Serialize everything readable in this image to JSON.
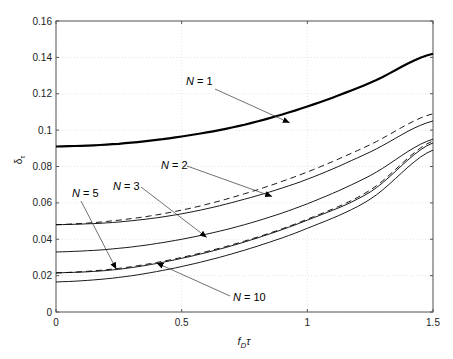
{
  "chart_data": {
    "type": "line",
    "title": "",
    "xlabel": "f_D τ",
    "ylabel": "δ_τ",
    "xlim": [
      0,
      1.5
    ],
    "ylim": [
      0,
      0.16
    ],
    "xticks": [
      "0",
      "0.5",
      "1",
      "1.5"
    ],
    "yticks": [
      "0",
      "0.02",
      "0.04",
      "0.06",
      "0.08",
      "0.1",
      "0.12",
      "0.14",
      "0.16"
    ],
    "grid": true,
    "legend": "none (inline annotations with arrows)",
    "x": [
      0,
      0.25,
      0.5,
      0.75,
      1.0,
      1.25,
      1.5
    ],
    "series": [
      {
        "name": "N = 1",
        "style": "thick solid",
        "values": [
          0.091,
          0.0925,
          0.0965,
          0.103,
          0.113,
          0.126,
          0.142
        ]
      },
      {
        "name": "N = 2 (dashed)",
        "style": "dashed",
        "values": [
          0.048,
          0.0505,
          0.056,
          0.065,
          0.077,
          0.092,
          0.109
        ]
      },
      {
        "name": "N = 2",
        "style": "solid",
        "values": [
          0.048,
          0.0495,
          0.054,
          0.062,
          0.073,
          0.088,
          0.105
        ]
      },
      {
        "name": "N = 3",
        "style": "solid",
        "values": [
          0.033,
          0.035,
          0.04,
          0.048,
          0.0595,
          0.075,
          0.095
        ]
      },
      {
        "name": "N = 5 (dashed)",
        "style": "dashed",
        "values": [
          0.0215,
          0.024,
          0.03,
          0.039,
          0.051,
          0.067,
          0.094
        ]
      },
      {
        "name": "N = 5",
        "style": "solid",
        "values": [
          0.0215,
          0.0235,
          0.0295,
          0.0385,
          0.0505,
          0.066,
          0.093
        ]
      },
      {
        "name": "N = 10",
        "style": "solid",
        "values": [
          0.0165,
          0.019,
          0.025,
          0.034,
          0.046,
          0.062,
          0.089
        ]
      }
    ],
    "annotations": [
      {
        "text": "N = 1",
        "points_to_x": 0.93,
        "points_to_y": 0.104
      },
      {
        "text": "N = 2",
        "points_to_x": 0.86,
        "points_to_y": 0.0635
      },
      {
        "text": "N = 3",
        "points_to_x": 0.6,
        "points_to_y": 0.041
      },
      {
        "text": "N = 5",
        "points_to_x": 0.24,
        "points_to_y": 0.0235
      },
      {
        "text": "N = 10",
        "points_to_x": 0.4,
        "points_to_y": 0.027
      }
    ]
  },
  "labels": {
    "xlabel_main": "f",
    "xlabel_sub": "D",
    "xlabel_tail": "τ",
    "ylabel_main": "δ",
    "ylabel_sub": "τ",
    "ann_n1": "N = 1",
    "ann_n2": "N = 2",
    "ann_n3": "N = 3",
    "ann_n5": "N = 5",
    "ann_n10": "N = 10"
  }
}
